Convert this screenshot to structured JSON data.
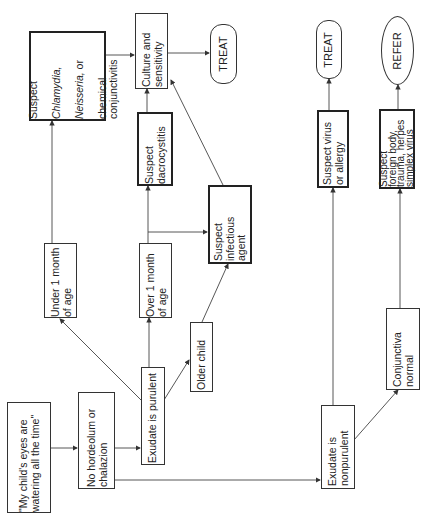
{
  "diagram": {
    "type": "flowchart",
    "orientation": "rotated -90deg",
    "nodes": {
      "start": {
        "text": "\"My child's eyes are\nwatering all the time\""
      },
      "no_hordeolum": {
        "text": "No hordeolum or\nchalazion"
      },
      "purulent": {
        "text": "Exudate is purulent"
      },
      "under1": {
        "text": "Under 1 month\nof age"
      },
      "over1": {
        "text": "Over 1 month\nof age"
      },
      "older": {
        "text": "Older child"
      },
      "chlamydia": {
        "line1": "Suspect",
        "line2": "Chlamydia,",
        "line3": "Neisseria,",
        "line3b": " or",
        "line4": "chemical\nconjunctivitis"
      },
      "culture": {
        "text": "Culture and\nsensitivity"
      },
      "treat1": {
        "text": "TREAT"
      },
      "dacro": {
        "text": "Suspect\ndacrocystitis"
      },
      "infectious": {
        "text": "Suspect\ninfectious\nagent"
      },
      "nonpurulent": {
        "text": "Exudate is\nnonpurulent"
      },
      "conj_normal": {
        "text": "Conjunctiva\nnormal"
      },
      "virus": {
        "text": "Suspect virus\nor allergy"
      },
      "foreign": {
        "text": "Suspect\nforeign body,\ntrauma, herpes\nsimplex virus"
      },
      "treat2": {
        "text": "TREAT"
      },
      "refer": {
        "text": "REFER"
      }
    },
    "edges": [
      [
        "start",
        "no_hordeolum"
      ],
      [
        "no_hordeolum",
        "purulent"
      ],
      [
        "no_hordeolum",
        "nonpurulent"
      ],
      [
        "purulent",
        "under1"
      ],
      [
        "purulent",
        "over1"
      ],
      [
        "purulent",
        "older"
      ],
      [
        "under1",
        "chlamydia"
      ],
      [
        "over1",
        "dacro"
      ],
      [
        "over1",
        "infectious"
      ],
      [
        "older",
        "infectious"
      ],
      [
        "chlamydia",
        "culture"
      ],
      [
        "dacro",
        "culture"
      ],
      [
        "infectious",
        "culture"
      ],
      [
        "culture",
        "treat1"
      ],
      [
        "nonpurulent",
        "virus"
      ],
      [
        "nonpurulent",
        "conj_normal"
      ],
      [
        "virus",
        "treat2"
      ],
      [
        "conj_normal",
        "foreign"
      ],
      [
        "foreign",
        "refer"
      ]
    ],
    "colors": {
      "line": "#333333",
      "background": "#ffffff"
    }
  }
}
